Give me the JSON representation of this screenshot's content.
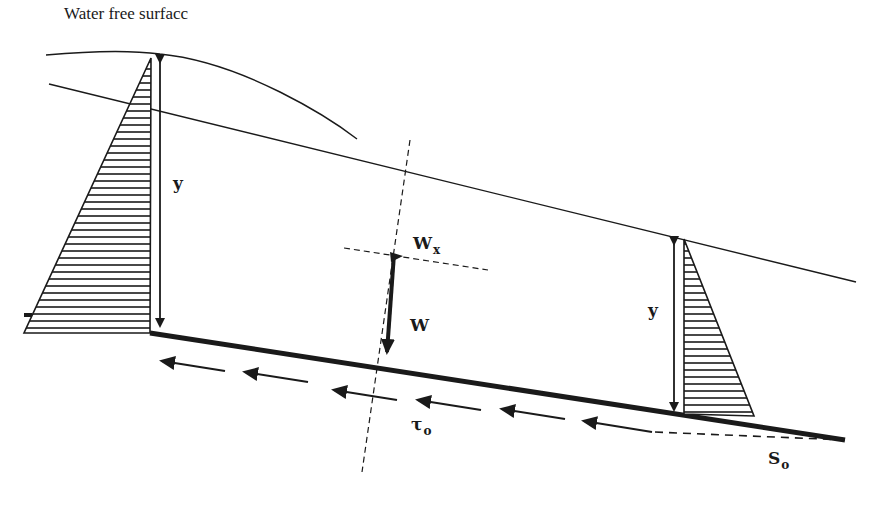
{
  "diagram": {
    "title_label": "Water free surfacc",
    "left_depth_label": "y",
    "right_depth_label": "y",
    "weight_label": "W",
    "weight_component_label": "W",
    "weight_component_subscript": "x",
    "shear_label": "τ",
    "shear_subscript": "o",
    "slope_label": "S",
    "slope_subscript": "o",
    "colors": {
      "ink": "#1a1a1a",
      "background": "#ffffff"
    }
  }
}
